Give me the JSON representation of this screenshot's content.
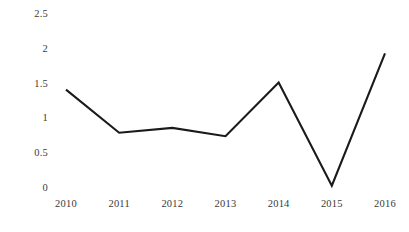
{
  "chart_data": {
    "type": "line",
    "title": "",
    "subtitle": "",
    "xlabel": "",
    "ylabel": "",
    "categories": [
      "2010",
      "2011",
      "2012",
      "2013",
      "2014",
      "2015",
      "2016"
    ],
    "x": [
      2010,
      2011,
      2012,
      2013,
      2014,
      2015,
      2016
    ],
    "values": [
      1.4,
      0.78,
      0.85,
      0.73,
      1.5,
      0.02,
      1.92
    ],
    "series": [
      {
        "name": "series-1",
        "values": [
          1.4,
          0.78,
          0.85,
          0.73,
          1.5,
          0.02,
          1.92
        ],
        "color": "#1a1a1a",
        "line_width": 2.1,
        "markers": false
      }
    ],
    "ylim": [
      0,
      2.5
    ],
    "y_ticks": [
      0,
      0.5,
      1,
      1.5,
      2,
      2.5
    ],
    "y_tick_labels": [
      "0",
      "0.5",
      "1",
      "1.5",
      "2",
      "2.5"
    ],
    "x_tick_labels": [
      "2010",
      "2011",
      "2012",
      "2013",
      "2014",
      "2015",
      "2016"
    ],
    "grid": false,
    "axis_lines": false,
    "legend": false,
    "legend_position": "none",
    "annotations": [],
    "background_color": "#ffffff",
    "tick_label_color": "#3a3a3a"
  },
  "axis": {
    "y_labels": [
      "2.5",
      "2",
      "1.5",
      "1",
      "0.5",
      "0"
    ],
    "x_labels": [
      "2010",
      "2011",
      "2012",
      "2013",
      "2014",
      "2015",
      "2016"
    ]
  }
}
